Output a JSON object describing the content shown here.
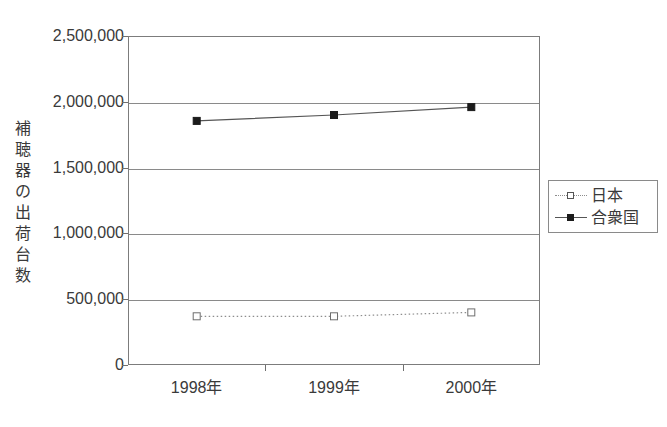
{
  "chart_data": {
    "type": "line",
    "title": "",
    "xlabel": "",
    "ylabel": "補聴器の出荷台数",
    "categories": [
      "1998年",
      "1999年",
      "2000年"
    ],
    "ylim": [
      0,
      2500000
    ],
    "ytick_labels": [
      "2,500,000",
      "2,000,000",
      "1,500,000",
      "1,000,000",
      "500,000",
      "0"
    ],
    "ytick_values": [
      2500000,
      2000000,
      1500000,
      1000000,
      500000,
      0
    ],
    "grid": true,
    "legend_position": "right",
    "series": [
      {
        "name": "日本",
        "values": [
          370000,
          370000,
          400000
        ],
        "marker": "open-square",
        "line_style": "dotted",
        "color": "#8d8d8d"
      },
      {
        "name": "合衆国",
        "values": [
          1855000,
          1900000,
          1960000
        ],
        "marker": "filled-square",
        "line_style": "solid",
        "color": "#555555"
      }
    ]
  },
  "axis": {
    "y_title_chars": [
      "補",
      "聴",
      "器",
      "の",
      "出",
      "荷",
      "台",
      "数"
    ]
  },
  "legend": {
    "entries": [
      {
        "label": "日本",
        "marker": "open-square",
        "line": "dotted"
      },
      {
        "label": "合衆国",
        "marker": "filled-square",
        "line": "solid"
      }
    ]
  },
  "colors": {
    "frame": "#7c7c7c",
    "grid": "#8a8a8a",
    "text": "#3a3a3a",
    "japan": "#8d8d8d",
    "usa": "#555555",
    "background": "#ffffff"
  }
}
